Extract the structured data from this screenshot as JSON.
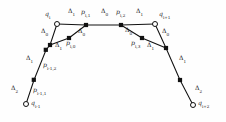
{
  "figure": {
    "type": "control-polygon-diagram",
    "width": 226,
    "height": 122,
    "background_color": "#fefefe",
    "stroke_color": "#111111",
    "label_color": "#1a1a1a"
  },
  "knot_points": [
    {
      "id": "q-im1",
      "base": "q",
      "sub": "i-1",
      "x": 26,
      "y": 104,
      "marker": "open-circle"
    },
    {
      "id": "q-i",
      "base": "q",
      "sub": "i",
      "x": 57,
      "y": 24,
      "marker": "open-circle"
    },
    {
      "id": "q-ip1",
      "base": "q",
      "sub": "i+1",
      "x": 155,
      "y": 24,
      "marker": "open-circle"
    },
    {
      "id": "q-ip2",
      "base": "q",
      "sub": "i+2",
      "x": 193,
      "y": 105,
      "marker": "open-circle"
    }
  ],
  "control_points": [
    {
      "id": "p-im1-1",
      "base": "p",
      "sub": "i-1,1",
      "x": 34,
      "y": 80,
      "marker": "filled-square"
    },
    {
      "id": "p-im1-2",
      "base": "p",
      "sub": "i-1,2",
      "x": 46,
      "y": 50,
      "marker": "filled-square"
    },
    {
      "id": "p-i-0",
      "base": "p",
      "sub": "i,0",
      "x": 69,
      "y": 38,
      "marker": "filled-square"
    },
    {
      "id": "p-i-1",
      "base": "p",
      "sub": "i,1",
      "x": 86,
      "y": 25,
      "marker": "filled-square"
    },
    {
      "id": "p-i-2",
      "base": "p",
      "sub": "i,2",
      "x": 121,
      "y": 25,
      "marker": "filled-square"
    },
    {
      "id": "p-i-3",
      "base": "p",
      "sub": "i,3",
      "x": 142,
      "y": 38,
      "marker": "filled-square"
    },
    {
      "id": "p-ip1-1",
      "base": "p",
      "sub": "i+1,1",
      "x": 163,
      "y": 50,
      "marker": "filled-square"
    },
    {
      "id": "p-ip1-2",
      "base": "p",
      "sub": "i+1,2",
      "x": 180,
      "y": 80,
      "marker": "filled-square"
    }
  ],
  "extra_vertices": [
    {
      "id": "v-left-join",
      "x": 50,
      "y": 45,
      "marker": "filled-square"
    },
    {
      "id": "v-right-join",
      "x": 166,
      "y": 48,
      "marker": "filled-square"
    }
  ],
  "point_labels": [
    {
      "id": "lbl-q-im1",
      "base": "q",
      "sub": "i-1",
      "x": 31,
      "y": 104
    },
    {
      "id": "lbl-q-i",
      "base": "q",
      "sub": "i",
      "x": 45,
      "y": 15
    },
    {
      "id": "lbl-q-ip1",
      "base": "q",
      "sub": "i+1",
      "x": 159,
      "y": 15
    },
    {
      "id": "lbl-q-ip2",
      "base": "q",
      "sub": "i+2",
      "x": 198,
      "y": 104
    },
    {
      "id": "lbl-p-im1-1",
      "base": "p",
      "sub": "i-1,1",
      "x": 34,
      "y": 91
    },
    {
      "id": "lbl-p-im1-2",
      "base": "p",
      "sub": "i-1,2",
      "x": 44,
      "y": 66
    },
    {
      "id": "lbl-p-i-0",
      "base": "p",
      "sub": "i,0",
      "x": 67,
      "y": 43
    },
    {
      "id": "lbl-p-i-1",
      "base": "p",
      "sub": "i,1",
      "x": 82,
      "y": 13
    },
    {
      "id": "lbl-p-i-2",
      "base": "p",
      "sub": "i,2",
      "x": 117,
      "y": 13
    },
    {
      "id": "lbl-p-i-3",
      "base": "p",
      "sub": "i,3",
      "x": 133,
      "y": 43
    }
  ],
  "interval_labels": [
    {
      "id": "d-left-2",
      "base": "Δ",
      "sub": "2",
      "x": 12,
      "y": 88
    },
    {
      "id": "d-left-1a",
      "base": "Δ",
      "sub": "1",
      "x": 27,
      "y": 58
    },
    {
      "id": "d-left-1b",
      "base": "Δ",
      "sub": "1",
      "x": 56,
      "y": 45
    },
    {
      "id": "d-left-0a",
      "base": "Δ",
      "sub": "0",
      "x": 42,
      "y": 31
    },
    {
      "id": "d-left-0b",
      "base": "Δ",
      "sub": "0",
      "x": 79,
      "y": 31
    },
    {
      "id": "d-top-1a",
      "base": "Δ",
      "sub": "1",
      "x": 69,
      "y": 12
    },
    {
      "id": "d-top-0",
      "base": "Δ",
      "sub": "0",
      "x": 102,
      "y": 12
    },
    {
      "id": "d-top-1b",
      "base": "Δ",
      "sub": "1",
      "x": 136,
      "y": 12
    },
    {
      "id": "d-right-0a",
      "base": "Δ",
      "sub": "0",
      "x": 126,
      "y": 30
    },
    {
      "id": "d-right-0b",
      "base": "Δ",
      "sub": "0",
      "x": 163,
      "y": 31
    },
    {
      "id": "d-right-1a",
      "base": "Δ",
      "sub": "1",
      "x": 148,
      "y": 45
    },
    {
      "id": "d-right-1b",
      "base": "Δ",
      "sub": "1",
      "x": 180,
      "y": 58
    },
    {
      "id": "d-right-2",
      "base": "Δ",
      "sub": "2",
      "x": 196,
      "y": 88
    }
  ],
  "polyline_left": "26,104 34,80 46,50 50,45 57,24",
  "polyline_left_inner": "50,45 69,38 86,25 57,24",
  "polyline_top": "57,24 86,25 121,25 155,24",
  "polyline_right_inner": "121,25 142,38 166,48 155,24",
  "polyline_right": "155,24 166,48 180,80 193,105"
}
